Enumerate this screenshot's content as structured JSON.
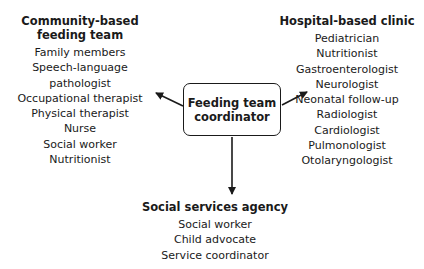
{
  "center": {
    "line1": "Feeding team",
    "line2": "coordinator"
  },
  "groups": {
    "community": {
      "title_line1": "Community-based",
      "title_line2": "feeding team",
      "items": [
        "Family members",
        "Speech-language pathologist",
        "Occupational therapist",
        "Physical therapist",
        "Nurse",
        "Social worker",
        "Nutritionist"
      ]
    },
    "hospital": {
      "title": "Hospital-based clinic",
      "items": [
        "Pediatrician",
        "Nutritionist",
        "Gastroenterologist",
        "Neurologist",
        "Neonatal follow-up",
        "Radiologist",
        "Cardiologist",
        "Pulmonologist",
        "Otolaryngologist"
      ]
    },
    "social": {
      "title": "Social services agency",
      "items": [
        "Social worker",
        "Child advocate",
        "Service coordinator"
      ]
    }
  },
  "colors": {
    "stroke": "#1a1a1a",
    "background": "#ffffff"
  }
}
